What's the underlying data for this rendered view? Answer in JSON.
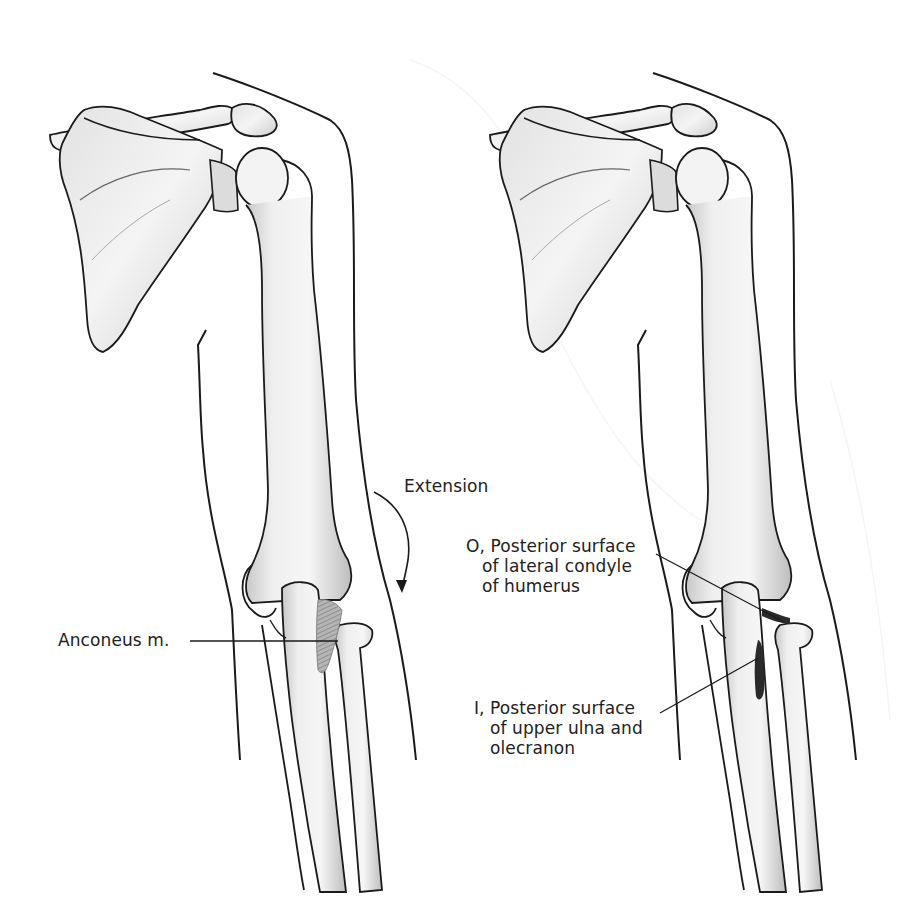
{
  "figure": {
    "panels": [
      {
        "id": "left",
        "view": "anconeus muscle shown",
        "labels": {
          "motion": "Extension",
          "muscle": "Anconeus m."
        }
      },
      {
        "id": "right",
        "view": "origin and insertion marked",
        "labels": {
          "origin": [
            "O, Posterior surface",
            "of lateral condyle",
            "of humerus"
          ],
          "insertion": [
            "I, Posterior surface",
            "of upper ulna and",
            "olecranon"
          ]
        }
      }
    ]
  },
  "colors": {
    "background": "#ffffff",
    "outline": "#1a1a1a",
    "bone_fill": "#f1f1f1",
    "bone_shade": "#c9c9c9",
    "muscle": "#8a8a8a",
    "insertion_mark": "#2a2a2a",
    "bleed_through": "#ececec"
  }
}
